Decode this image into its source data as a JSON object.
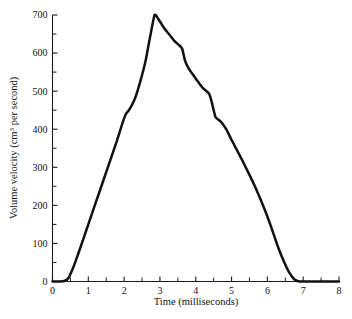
{
  "figure": {
    "background_color": "#ffffff",
    "curve_color": "#111111",
    "axis_color": "#1a1a1a"
  },
  "axes": {
    "y": {
      "label_prefix": "Volume velocity (cm",
      "label_exponent": "3",
      "label_suffix": " per second)",
      "label_full": "Volume velocity (cm3 per second)",
      "major_ticks": [
        "0",
        "100",
        "200",
        "300",
        "400",
        "500",
        "600",
        "700"
      ],
      "minor_tick_count_between": 1
    },
    "x": {
      "label": "Time (milliseconds)",
      "major_ticks": [
        "0",
        "1",
        "2",
        "3",
        "4",
        "5",
        "6",
        "7",
        "8"
      ],
      "minor_tick_count_between": 1
    }
  },
  "scan_bleed": {
    "top": "",
    "bottom": ""
  },
  "chart_data": {
    "type": "line",
    "title": "",
    "subtitle": "",
    "xlabel": "Time (milliseconds)",
    "ylabel": "Volume velocity (cm3 per second)",
    "xlim": [
      0,
      8
    ],
    "ylim": [
      0,
      700
    ],
    "xticks": [
      0,
      1,
      2,
      3,
      4,
      5,
      6,
      7,
      8
    ],
    "yticks": [
      0,
      100,
      200,
      300,
      400,
      500,
      600,
      700
    ],
    "x_minor_step": 0.5,
    "y_minor_step": 50,
    "grid": false,
    "legend": false,
    "legend_position": "none",
    "series": [
      {
        "name": "Glottal volume velocity",
        "x": [
          0.0,
          0.2,
          0.35,
          0.45,
          0.55,
          0.65,
          0.8,
          1.0,
          1.2,
          1.4,
          1.6,
          1.8,
          1.95,
          2.05,
          2.15,
          2.3,
          2.45,
          2.6,
          2.72,
          2.85,
          2.95,
          3.1,
          3.25,
          3.4,
          3.52,
          3.62,
          3.7,
          3.8,
          3.95,
          4.1,
          4.2,
          4.3,
          4.38,
          4.45,
          4.55,
          4.7,
          4.85,
          5.0,
          5.15,
          5.3,
          5.5,
          5.7,
          5.9,
          6.1,
          6.3,
          6.45,
          6.6,
          6.75,
          6.9,
          7.2,
          7.6,
          8.0
        ],
        "y": [
          0,
          0,
          2,
          10,
          30,
          55,
          95,
          150,
          205,
          260,
          315,
          370,
          415,
          440,
          452,
          480,
          525,
          580,
          640,
          700,
          690,
          668,
          650,
          632,
          622,
          612,
          580,
          560,
          540,
          520,
          508,
          500,
          492,
          470,
          432,
          420,
          400,
          372,
          345,
          318,
          280,
          240,
          195,
          145,
          90,
          55,
          25,
          6,
          0,
          0,
          0,
          0
        ]
      }
    ],
    "annotations": [
      {
        "text": "peak",
        "x": 2.85,
        "y": 700
      },
      {
        "text": "shoulder",
        "x": 3.62,
        "y": 612
      },
      {
        "text": "shoulder",
        "x": 4.3,
        "y": 500
      },
      {
        "text": "onset",
        "x": 0.35,
        "y": 0
      },
      {
        "text": "closure",
        "x": 6.9,
        "y": 0
      }
    ]
  }
}
